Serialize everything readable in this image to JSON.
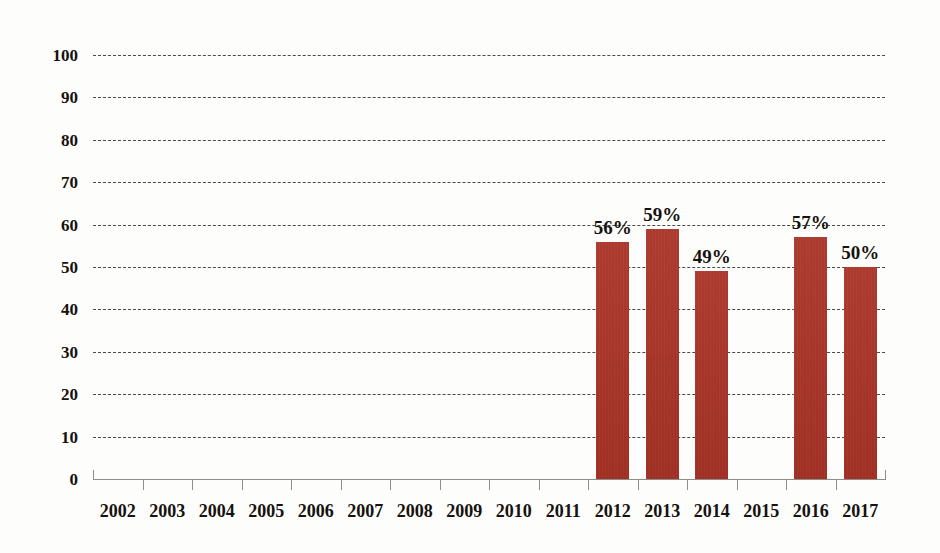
{
  "chart_data": {
    "type": "bar",
    "title": "",
    "subtitle": "",
    "xlabel": "",
    "ylabel": "",
    "categories": [
      "2002",
      "2003",
      "2004",
      "2005",
      "2006",
      "2007",
      "2008",
      "2009",
      "2010",
      "2011",
      "2012",
      "2013",
      "2014",
      "2015",
      "2016",
      "2017"
    ],
    "values": [
      null,
      null,
      null,
      null,
      null,
      null,
      null,
      null,
      null,
      null,
      56,
      59,
      49,
      null,
      57,
      50
    ],
    "data_labels": [
      "",
      "",
      "",
      "",
      "",
      "",
      "",
      "",
      "",
      "",
      "56%",
      "59%",
      "49%",
      "",
      "57%",
      "50%"
    ],
    "ylim": [
      0,
      100
    ],
    "ytick_labels": [
      "100",
      "90",
      "80",
      "70",
      "60",
      "50",
      "40",
      "30",
      "20",
      "10",
      "0"
    ],
    "ytick_values": [
      100,
      90,
      80,
      70,
      60,
      50,
      40,
      30,
      20,
      10,
      0
    ],
    "grid": true,
    "grid_style": "dashed-horizontal",
    "legend": "none",
    "series": [
      {
        "name": "",
        "color": "#a93226",
        "values": [
          null,
          null,
          null,
          null,
          null,
          null,
          null,
          null,
          null,
          null,
          56,
          59,
          49,
          null,
          57,
          50
        ]
      }
    ]
  },
  "colors": {
    "bar": "#a93226",
    "background": "#fdfdfb",
    "grid": "#2b2b2b",
    "axis": "#8d8d8a",
    "text": "#15120f"
  }
}
